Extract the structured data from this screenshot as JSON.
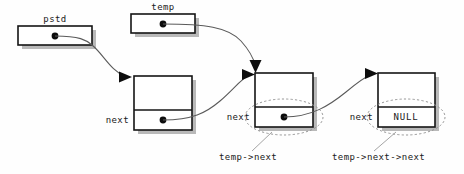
{
  "diagram": {
    "background_color": "#fefefe",
    "stroke_color": "#141414",
    "shadow_color": "#b9b9b9",
    "annotation_color": "#8c8c8c"
  },
  "pointer_boxes": [
    {
      "id": "pstd",
      "label": "pstd",
      "x": 18,
      "y": 26,
      "width": 74,
      "height": 19,
      "dot_x": 55,
      "dot_y": 36
    },
    {
      "id": "temp",
      "label": "temp",
      "x": 131,
      "y": 14,
      "width": 64,
      "height": 19,
      "dot_x": 163,
      "dot_y": 24
    }
  ],
  "nodes": [
    {
      "id": "node1",
      "x": 134,
      "y": 76,
      "width": 58,
      "height": 54,
      "divider_y": 110,
      "next_label": "next",
      "next_value": "",
      "has_dot": true,
      "dot_x": 163,
      "dot_y": 120,
      "highlighted": false
    },
    {
      "id": "node2",
      "x": 255,
      "y": 73,
      "width": 58,
      "height": 54,
      "divider_y": 107,
      "next_label": "next",
      "next_value": "",
      "has_dot": true,
      "dot_x": 284,
      "dot_y": 117,
      "highlighted": true
    },
    {
      "id": "node3",
      "x": 378,
      "y": 73,
      "width": 57,
      "height": 54,
      "divider_y": 107,
      "next_label": "next",
      "next_value": "NULL",
      "has_dot": false,
      "dot_x": 0,
      "dot_y": 0,
      "highlighted": true
    }
  ],
  "annotations": [
    {
      "id": "annot-temp-next",
      "label": "temp->next",
      "x": 219,
      "y": 160,
      "leader_from_x": 272,
      "leader_from_y": 129,
      "leader_to_x": 252,
      "leader_to_y": 151
    },
    {
      "id": "annot-temp-next-next",
      "label": "temp->next->next",
      "x": 332,
      "y": 160,
      "leader_from_x": 396,
      "leader_from_y": 129,
      "leader_to_x": 372,
      "leader_to_y": 151
    }
  ],
  "arrows": [
    {
      "id": "pstd-to-node1",
      "from": "pstd",
      "to": "node1",
      "path": "M 55 36 C 80 36 86 40 92 45 C 104 55 110 70 126 77",
      "head": "131,77 119,72 119,82"
    },
    {
      "id": "temp-to-node2",
      "from": "temp",
      "to": "node2",
      "path": "M 163 24 C 200 24 226 28 240 42 C 250 52 253 60 255 66",
      "head": "256,72 250,60 261,60"
    },
    {
      "id": "node1-to-node2",
      "from": "node1",
      "to": "node2",
      "path": "M 163 120 C 190 120 205 112 220 100 C 234 88 240 80 248 76",
      "head": "253,75 241,70 241,80"
    },
    {
      "id": "node2-to-node3",
      "from": "node2",
      "to": "node3",
      "path": "M 284 117 C 310 117 328 105 345 92 C 358 82 365 77 371 75",
      "head": "376,74 364,69 364,79"
    }
  ]
}
